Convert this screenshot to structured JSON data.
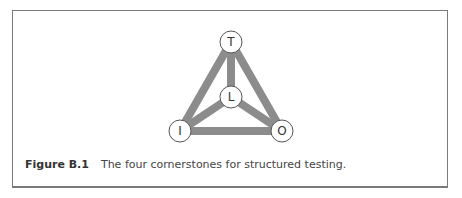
{
  "figure": {
    "nodes": [
      {
        "id": "T",
        "label": "T",
        "cx": 231,
        "cy": 42
      },
      {
        "id": "L",
        "label": "L",
        "cx": 231,
        "cy": 97
      },
      {
        "id": "I",
        "label": "I",
        "cx": 180,
        "cy": 131
      },
      {
        "id": "O",
        "label": "O",
        "cx": 282,
        "cy": 131
      }
    ],
    "edges": [
      [
        "T",
        "I"
      ],
      [
        "T",
        "O"
      ],
      [
        "I",
        "O"
      ],
      [
        "T",
        "L"
      ],
      [
        "L",
        "I"
      ],
      [
        "L",
        "O"
      ]
    ],
    "edge_color": "#8c8c8c",
    "node_stroke": "#555555"
  },
  "caption": {
    "label": "Figure B.1",
    "text": "The four cornerstones for structured testing."
  }
}
